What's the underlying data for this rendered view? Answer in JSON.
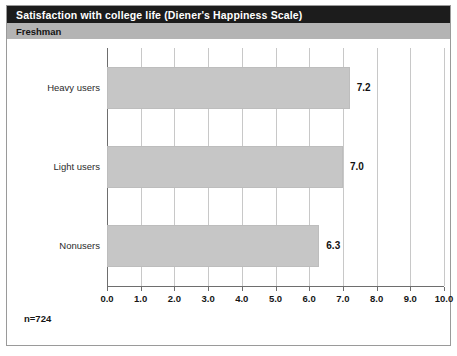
{
  "header": {
    "title": "Satisfaction with college life (Diener's Happiness Scale)",
    "subtitle": "Freshman"
  },
  "footnote": "n=724",
  "colors": {
    "title_bar": "#1c1c1c",
    "title_text": "#ffffff",
    "subtitle_bar": "#b4b4b4",
    "bar_fill": "#c6c6c6",
    "gridline": "#c8c8c8",
    "axis": "#6e6e6e",
    "frame": "#9a9a9a",
    "background": "#ffffff"
  },
  "chart_data": {
    "type": "bar",
    "orientation": "horizontal",
    "title": "Satisfaction with college life (Diener's Happiness Scale)",
    "subtitle": "Freshman",
    "categories": [
      "Heavy users",
      "Light users",
      "Nonusers"
    ],
    "values": [
      7.2,
      7.0,
      6.3
    ],
    "value_labels": [
      "7.2",
      "7.0",
      "6.3"
    ],
    "xlabel": "",
    "ylabel": "",
    "xlim": [
      0.0,
      10.0
    ],
    "xticks": [
      0.0,
      1.0,
      2.0,
      3.0,
      4.0,
      5.0,
      6.0,
      7.0,
      8.0,
      9.0,
      10.0
    ],
    "xtick_labels": [
      "0.0",
      "1.0",
      "2.0",
      "3.0",
      "4.0",
      "5.0",
      "6.0",
      "7.0",
      "8.0",
      "9.0",
      "10.0"
    ],
    "grid": true,
    "grid_axis": "x",
    "legend": false,
    "annotations": [
      "n=724"
    ]
  }
}
